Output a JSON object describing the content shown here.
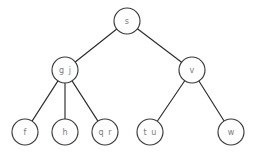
{
  "diagram": {
    "type": "tree",
    "background_color": "#ffffff",
    "node_fill": "#ffffff",
    "node_stroke": "#3a3a3a",
    "edge_color": "#2b2b2b",
    "label_color": "#7a7a7a",
    "node_radius": 13,
    "nodes": [
      {
        "id": "s",
        "label": "s",
        "cx": 127,
        "cy": 21,
        "level": 0
      },
      {
        "id": "gj",
        "label": "g j",
        "cx": 65,
        "cy": 70,
        "level": 1
      },
      {
        "id": "v",
        "label": "v",
        "cx": 192,
        "cy": 70,
        "level": 1
      },
      {
        "id": "f",
        "label": "f",
        "cx": 25,
        "cy": 132,
        "level": 2
      },
      {
        "id": "h",
        "label": "h",
        "cx": 65,
        "cy": 132,
        "level": 2
      },
      {
        "id": "qr",
        "label": "q r",
        "cx": 105,
        "cy": 132,
        "level": 2
      },
      {
        "id": "tu",
        "label": "t u",
        "cx": 150,
        "cy": 132,
        "level": 2
      },
      {
        "id": "w",
        "label": "w",
        "cx": 231,
        "cy": 132,
        "level": 2
      }
    ],
    "edges": [
      {
        "from": "s",
        "to": "gj"
      },
      {
        "from": "s",
        "to": "v"
      },
      {
        "from": "gj",
        "to": "f"
      },
      {
        "from": "gj",
        "to": "h"
      },
      {
        "from": "gj",
        "to": "qr"
      },
      {
        "from": "v",
        "to": "tu"
      },
      {
        "from": "v",
        "to": "w"
      }
    ]
  }
}
